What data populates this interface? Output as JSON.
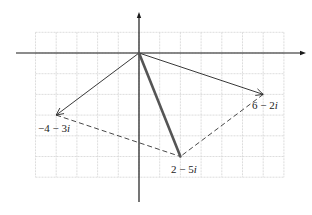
{
  "figure": {
    "grid": {
      "x_min": -5,
      "x_max": 7,
      "y_min": -6,
      "y_max": 1,
      "unit_px": 20.7,
      "origin_px": [
        139,
        53
      ],
      "color": "#d4d4d4"
    },
    "axes": {
      "color": "#1a1a1a",
      "horizontal": {
        "from_px": 16,
        "to_px": 306
      },
      "vertical": {
        "from_px": 12,
        "to_px": 202
      }
    },
    "vectors": [
      {
        "name": "z1",
        "label": "6 − 2i",
        "re": 6,
        "im": -2,
        "style": "solid-arrow"
      },
      {
        "name": "z2",
        "label": "−4 − 3i",
        "re": -4,
        "im": -3,
        "style": "solid-arrow"
      },
      {
        "name": "sum",
        "label": "2 − 5i",
        "re": 2,
        "im": -5,
        "style": "thick-solid"
      }
    ],
    "dashed_edges": [
      {
        "from": "z2",
        "to": "sum"
      },
      {
        "from": "z1",
        "to": "sum"
      }
    ],
    "labels": {
      "z1": {
        "text_main": "6 − 2",
        "text_i": "i"
      },
      "z2": {
        "text_main": "−4 − 3",
        "text_i": "i"
      },
      "sum": {
        "text_main": "2 − 5",
        "text_i": "i"
      }
    },
    "colors": {
      "line": "#222222",
      "thick": "#555555",
      "dashed": "#333333"
    }
  }
}
